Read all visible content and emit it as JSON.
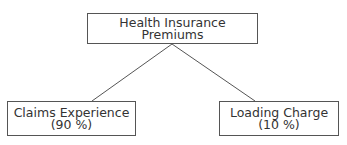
{
  "diagram": {
    "root": {
      "label": "Health Insurance Premiums"
    },
    "children": [
      {
        "label": "Claims Experience",
        "share": "(90 %)"
      },
      {
        "label": "Loading Charge",
        "share": "(10 %)"
      }
    ],
    "colors": {
      "line": "#555555",
      "text": "#333333",
      "background": "#ffffff"
    }
  }
}
